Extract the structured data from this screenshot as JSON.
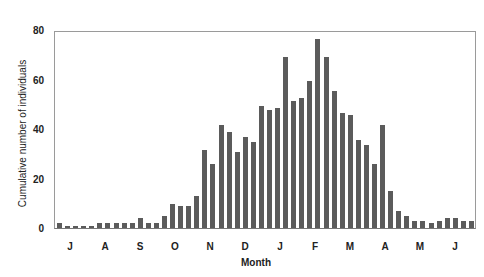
{
  "chart_data": {
    "type": "bar",
    "title": "",
    "xlabel": "Month",
    "ylabel": "Cumulative number of individuals",
    "ylim": [
      0,
      80
    ],
    "yticks": [
      0,
      20,
      40,
      60,
      80
    ],
    "month_ticks": [
      "J",
      "A",
      "S",
      "O",
      "N",
      "D",
      "J",
      "F",
      "M",
      "A",
      "M",
      "J"
    ],
    "grid": false,
    "values": [
      2,
      1,
      1,
      1,
      1,
      2,
      2,
      2,
      2,
      2,
      4,
      2,
      2,
      5,
      10,
      9,
      9,
      13,
      32,
      26,
      42,
      39,
      31,
      37,
      35,
      50,
      48,
      49,
      70,
      52,
      53,
      60,
      77,
      70,
      56,
      47,
      46,
      36,
      34,
      26,
      42,
      15,
      7,
      5,
      3,
      3,
      2,
      3,
      4,
      4,
      3,
      3
    ],
    "bar_color": "#5b5b5b"
  }
}
